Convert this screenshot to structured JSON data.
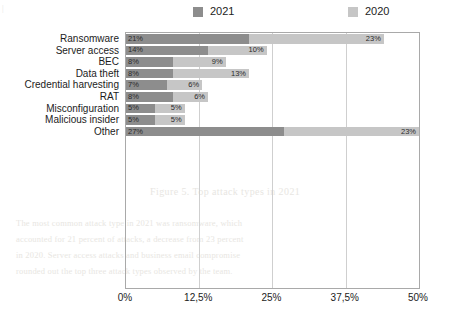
{
  "chart_data": {
    "type": "bar",
    "orientation": "horizontal",
    "stacked": true,
    "title": "",
    "xlabel": "",
    "ylabel": "",
    "xlim": [
      0,
      50
    ],
    "grid": true,
    "legend_position": "top",
    "categories": [
      "Ransomware",
      "Server access",
      "BEC",
      "Data theft",
      "Credential harvesting",
      "RAT",
      "Misconfiguration",
      "Malicious insider",
      "Other"
    ],
    "series": [
      {
        "name": "2021",
        "color": "#8d8d8d",
        "values": [
          21,
          14,
          8,
          8,
          7,
          8,
          5,
          5,
          27
        ],
        "labels": [
          "21%",
          "14%",
          "8%",
          "8%",
          "7%",
          "8%",
          "5%",
          "5%",
          "27%"
        ]
      },
      {
        "name": "2020",
        "color": "#c6c6c6",
        "values": [
          23,
          10,
          9,
          13,
          6,
          6,
          5,
          5,
          23
        ],
        "labels": [
          "23%",
          "10%",
          "9%",
          "13%",
          "6%",
          "6%",
          "5%",
          "5%",
          "23%"
        ]
      }
    ],
    "xticks": [
      "0%",
      "12,5%",
      "25%",
      "37,5%",
      "50%"
    ],
    "xtick_values": [
      0,
      12.5,
      25,
      37.5,
      50
    ]
  },
  "legend": {
    "items": [
      {
        "label": "2021",
        "color": "#8d8d8d"
      },
      {
        "label": "2020",
        "color": "#c6c6c6"
      }
    ]
  },
  "background_text": {
    "heading": "Figure 5. Top attack types in 2021",
    "lines": [
      "The most common attack type in 2021 was ransomware, which",
      "accounted for 21 percent of attacks, a decrease from 23 percent",
      "in 2020. Server access attacks and business email compromise",
      "rounded out the top three attack types observed by the team."
    ],
    "edge": "|"
  }
}
